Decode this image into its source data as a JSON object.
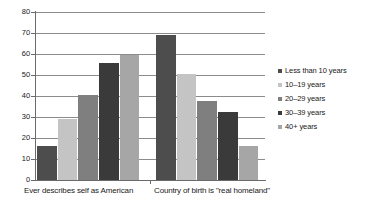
{
  "chart_data": {
    "type": "bar",
    "title": "",
    "xlabel": "",
    "ylabel": "",
    "ylim": [
      0,
      80
    ],
    "ytick_step": 10,
    "yticks": [
      80,
      70,
      60,
      50,
      40,
      30,
      20,
      10,
      0
    ],
    "grid": true,
    "legend_position": "right",
    "categories": [
      "Ever describes self as American",
      "Country of birth is \"real homeland\""
    ],
    "series": [
      {
        "name": "Less than 10 years",
        "color": "#4d4d4d",
        "values": [
          16,
          69
        ]
      },
      {
        "name": "10–19 years",
        "color": "#c4c4c4",
        "values": [
          29,
          50.5
        ]
      },
      {
        "name": "20–29 years",
        "color": "#7f7f7f",
        "values": [
          40.5,
          37.5
        ]
      },
      {
        "name": "30–39 years",
        "color": "#3a3a3a",
        "values": [
          55.5,
          32.5
        ]
      },
      {
        "name": "40+ years",
        "color": "#a6a6a6",
        "values": [
          59.5,
          16
        ]
      }
    ]
  },
  "legend": {
    "items": [
      {
        "label": "Less than 10 years"
      },
      {
        "label": "10–19 years"
      },
      {
        "label": "20–29 years"
      },
      {
        "label": "30–39 years"
      },
      {
        "label": "40+ years"
      }
    ]
  },
  "axis": {
    "y_labels": [
      "80",
      "70",
      "60",
      "50",
      "40",
      "30",
      "20",
      "10",
      "0"
    ]
  },
  "colors": {
    "axis": "#6b6b6b",
    "grid": "#8c8c8c",
    "text": "#1a1a1a",
    "background": "#ffffff"
  }
}
